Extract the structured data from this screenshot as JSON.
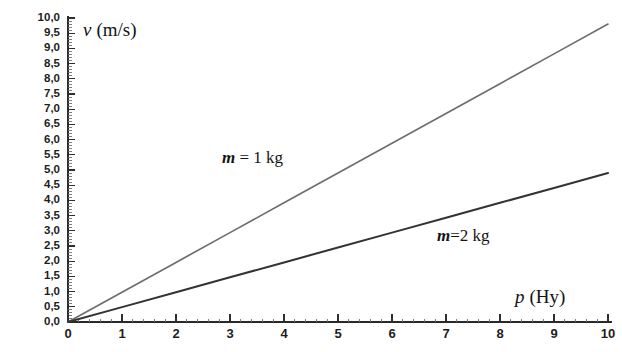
{
  "chart_data": {
    "type": "line",
    "title": "",
    "xlabel": "p (Hy)",
    "xlabel_variable": "p",
    "xlabel_unit": "(Hy)",
    "ylabel": "v (m/s)",
    "ylabel_variable": "v",
    "ylabel_unit": "(m/s)",
    "xlim": [
      0,
      10
    ],
    "ylim": [
      0,
      10
    ],
    "grid": false,
    "legend_position": "inline-annotation",
    "x_tick_labels": [
      "0",
      "1",
      "2",
      "3",
      "4",
      "5",
      "6",
      "7",
      "8",
      "9",
      "10"
    ],
    "x_tick_values": [
      0,
      1,
      2,
      3,
      4,
      5,
      6,
      7,
      8,
      9,
      10
    ],
    "y_tick_labels": [
      "0,0",
      "0,5",
      "1,0",
      "1,5",
      "2,0",
      "2,5",
      "3,0",
      "3,5",
      "4,0",
      "4,5",
      "5,0",
      "5,5",
      "6,0",
      "6,5",
      "7,0",
      "7,5",
      "8,0",
      "8,5",
      "9,0",
      "9,5",
      "10,0"
    ],
    "y_tick_values": [
      0,
      0.5,
      1,
      1.5,
      2,
      2.5,
      3,
      3.5,
      4,
      4.5,
      5,
      5.5,
      6,
      6.5,
      7,
      7.5,
      8,
      8.5,
      9,
      9.5,
      10
    ],
    "series": [
      {
        "name": "m = 1 kg",
        "annotation": "m = 1 kg",
        "annotation_variable": "m",
        "annotation_rest": " = 1 kg",
        "color": "#6e6e6e",
        "slope": 1.0,
        "x": [
          0,
          1,
          2,
          3,
          4,
          5,
          6,
          7,
          8,
          9,
          10
        ],
        "values": [
          0.0,
          0.98,
          1.96,
          2.94,
          3.92,
          4.9,
          5.88,
          6.86,
          7.84,
          8.82,
          9.8
        ]
      },
      {
        "name": "m = 2 kg",
        "annotation": "m=2 kg",
        "annotation_variable": "m",
        "annotation_rest": "=2 kg",
        "color": "#333333",
        "slope": 0.5,
        "x": [
          0,
          1,
          2,
          3,
          4,
          5,
          6,
          7,
          8,
          9,
          10
        ],
        "values": [
          0.0,
          0.49,
          0.98,
          1.47,
          1.96,
          2.45,
          2.94,
          3.43,
          3.92,
          4.41,
          4.9
        ]
      }
    ]
  }
}
